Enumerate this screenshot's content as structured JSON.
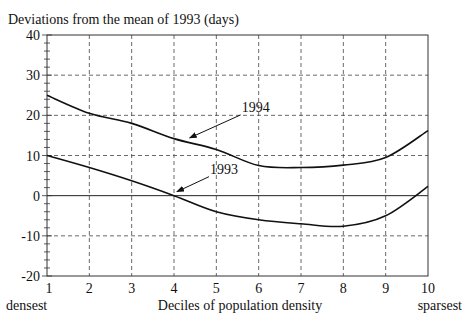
{
  "chart_data": {
    "type": "line",
    "title": "Deviations from the mean of 1993 (days)",
    "xlabel": "Deciles of population density",
    "xlabel_left": "densest",
    "xlabel_right": "sparsest",
    "ylabel": "",
    "x": [
      1,
      2,
      3,
      4,
      5,
      6,
      7,
      8,
      9,
      10
    ],
    "xticks": [
      "1",
      "2",
      "3",
      "4",
      "5",
      "6",
      "7",
      "8",
      "9",
      "10"
    ],
    "xlim": [
      1,
      10
    ],
    "ylim": [
      -20,
      40
    ],
    "yticks": [
      "40",
      "30",
      "20",
      "10",
      "0",
      "-10",
      "-20"
    ],
    "ytick_values": [
      40,
      30,
      20,
      10,
      0,
      -10,
      -20
    ],
    "grid": true,
    "series": [
      {
        "name": "1994",
        "values": [
          25,
          20.5,
          18,
          14.2,
          11.5,
          7.5,
          7,
          7.6,
          9.5,
          16.2
        ]
      },
      {
        "name": "1993",
        "values": [
          10,
          7,
          3.7,
          0,
          -4,
          -6,
          -7,
          -7.6,
          -5,
          2.3
        ]
      }
    ],
    "annotations": [
      {
        "text": "1994",
        "points_to_x": 4.3,
        "points_to_series": "1994"
      },
      {
        "text": "1993",
        "points_to_x": 4.0,
        "points_to_series": "1993"
      }
    ]
  }
}
